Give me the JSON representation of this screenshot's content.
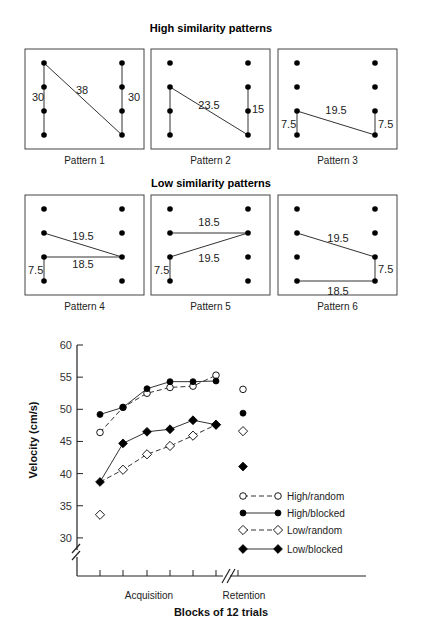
{
  "patterns": {
    "high_title": "High similarity patterns",
    "low_title": "Low similarity patterns",
    "items": [
      {
        "label": "Pattern 1",
        "segments": [
          {
            "from": [
              0,
              0
            ],
            "to": [
              0,
              3
            ]
          },
          {
            "from": [
              0,
              0
            ],
            "to": [
              1,
              3
            ]
          },
          {
            "from": [
              1,
              0
            ],
            "to": [
              1,
              3
            ]
          }
        ],
        "annotations": [
          {
            "text": "30",
            "pos": "left-mid"
          },
          {
            "text": "38",
            "pos": "diag"
          },
          {
            "text": "30",
            "pos": "right-mid"
          }
        ]
      },
      {
        "label": "Pattern 2",
        "segments": [
          {
            "from": [
              0,
              1
            ],
            "to": [
              0,
              3
            ]
          },
          {
            "from": [
              0,
              1
            ],
            "to": [
              1,
              3
            ]
          },
          {
            "from": [
              1,
              1
            ],
            "to": [
              1,
              3
            ]
          }
        ],
        "annotations": [
          {
            "text": "23.5",
            "pos": "diag"
          },
          {
            "text": "15",
            "pos": "right"
          }
        ]
      },
      {
        "label": "Pattern 3",
        "segments": [
          {
            "from": [
              0,
              2
            ],
            "to": [
              0,
              3
            ]
          },
          {
            "from": [
              0,
              2
            ],
            "to": [
              1,
              3
            ]
          },
          {
            "from": [
              1,
              2
            ],
            "to": [
              1,
              3
            ]
          }
        ],
        "annotations": [
          {
            "text": "7.5",
            "pos": "left"
          },
          {
            "text": "19.5",
            "pos": "diag"
          },
          {
            "text": "7.5",
            "pos": "right"
          }
        ]
      },
      {
        "label": "Pattern 4",
        "segments": [
          {
            "from": [
              0,
              1
            ],
            "to": [
              1,
              2
            ]
          },
          {
            "from": [
              0,
              2
            ],
            "to": [
              1,
              2
            ]
          },
          {
            "from": [
              0,
              2
            ],
            "to": [
              0,
              3
            ]
          }
        ],
        "annotations": [
          {
            "text": "19.5",
            "pos": "diag"
          },
          {
            "text": "18.5",
            "pos": "horiz"
          },
          {
            "text": "7.5",
            "pos": "left"
          }
        ]
      },
      {
        "label": "Pattern 5",
        "segments": [
          {
            "from": [
              0,
              1
            ],
            "to": [
              1,
              1
            ]
          },
          {
            "from": [
              0,
              2
            ],
            "to": [
              1,
              1
            ]
          },
          {
            "from": [
              0,
              2
            ],
            "to": [
              0,
              3
            ]
          }
        ],
        "annotations": [
          {
            "text": "18.5",
            "pos": "horiz"
          },
          {
            "text": "19.5",
            "pos": "diag"
          },
          {
            "text": "7.5",
            "pos": "left"
          }
        ]
      },
      {
        "label": "Pattern 6",
        "segments": [
          {
            "from": [
              0,
              1
            ],
            "to": [
              1,
              2
            ]
          },
          {
            "from": [
              1,
              2
            ],
            "to": [
              1,
              3
            ]
          },
          {
            "from": [
              0,
              3
            ],
            "to": [
              1,
              3
            ]
          }
        ],
        "annotations": [
          {
            "text": "19.5",
            "pos": "diag"
          },
          {
            "text": "7.5",
            "pos": "right"
          },
          {
            "text": "18.5",
            "pos": "horiz"
          }
        ]
      }
    ]
  },
  "chart_data": {
    "type": "line",
    "title": "",
    "xlabel": "Blocks of 12 trials",
    "ylabel": "Velocity (cm/s)",
    "x_groups": [
      "Acquisition",
      "Retention"
    ],
    "categories": [
      "A1",
      "A2",
      "A3",
      "A4",
      "A5",
      "A6",
      "Retention"
    ],
    "yticks": [
      30,
      35,
      40,
      45,
      50,
      55,
      60
    ],
    "ylim": [
      30,
      60
    ],
    "axis_breaks": [
      "y below 30",
      "x between acquisition and retention"
    ],
    "grid": false,
    "legend_position": "lower right inside",
    "series": [
      {
        "name": "High/random",
        "marker": "open-circle",
        "line": "dashed",
        "acquisition": [
          46.4,
          50.3,
          52.5,
          53.4,
          53.6,
          55.3
        ],
        "retention": 53.1
      },
      {
        "name": "High/blocked",
        "marker": "filled-circle",
        "line": "solid",
        "acquisition": [
          49.2,
          50.3,
          53.2,
          54.3,
          54.3,
          54.4
        ],
        "retention": 49.4
      },
      {
        "name": "Low/random",
        "marker": "open-diamond",
        "line": "dashed",
        "acquisition": [
          33.6,
          40.6,
          43.0,
          44.3,
          45.9,
          47.6
        ],
        "retention": 46.6
      },
      {
        "name": "Low/blocked",
        "marker": "filled-diamond",
        "line": "solid",
        "acquisition": [
          38.7,
          44.7,
          46.5,
          46.9,
          48.3,
          47.6
        ],
        "retention": 41.1
      }
    ]
  }
}
